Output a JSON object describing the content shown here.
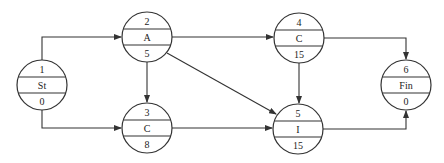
{
  "diagram": {
    "type": "precedence-network",
    "nodes": [
      {
        "id": "1",
        "activity": "St",
        "duration": "0",
        "cx": 42,
        "cy": 85
      },
      {
        "id": "2",
        "activity": "A",
        "duration": "5",
        "cx": 147,
        "cy": 37
      },
      {
        "id": "3",
        "activity": "C",
        "duration": "8",
        "cx": 147,
        "cy": 128
      },
      {
        "id": "4",
        "activity": "C",
        "duration": "15",
        "cx": 299,
        "cy": 38
      },
      {
        "id": "5",
        "activity": "I",
        "duration": "15",
        "cx": 298,
        "cy": 129
      },
      {
        "id": "6",
        "activity": "Fin",
        "duration": "0",
        "cx": 406,
        "cy": 85
      }
    ],
    "edges": [
      {
        "from": "1",
        "to": "2"
      },
      {
        "from": "1",
        "to": "3"
      },
      {
        "from": "2",
        "to": "3"
      },
      {
        "from": "2",
        "to": "4"
      },
      {
        "from": "2",
        "to": "5"
      },
      {
        "from": "3",
        "to": "5"
      },
      {
        "from": "4",
        "to": "5"
      },
      {
        "from": "4",
        "to": "6"
      },
      {
        "from": "5",
        "to": "6"
      }
    ],
    "colors": {
      "stroke": "#333333",
      "text": "#222222",
      "background": "#ffffff"
    }
  }
}
